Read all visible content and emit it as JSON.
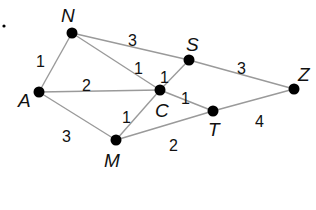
{
  "diagram": {
    "type": "weighted-graph",
    "nodes": [
      {
        "id": "N",
        "label": "N",
        "x": 72,
        "y": 33,
        "lx": 61,
        "ly": 22
      },
      {
        "id": "S",
        "label": "S",
        "x": 189,
        "y": 60,
        "lx": 186,
        "ly": 51
      },
      {
        "id": "Z",
        "label": "Z",
        "x": 294,
        "y": 89,
        "lx": 298,
        "ly": 81
      },
      {
        "id": "A",
        "label": "A",
        "x": 39,
        "y": 92,
        "lx": 18,
        "ly": 107
      },
      {
        "id": "C",
        "label": "C",
        "x": 160,
        "y": 90,
        "lx": 155,
        "ly": 117
      },
      {
        "id": "T",
        "label": "T",
        "x": 213,
        "y": 111,
        "lx": 208,
        "ly": 136
      },
      {
        "id": "M",
        "label": "M",
        "x": 116,
        "y": 140,
        "lx": 104,
        "ly": 167
      }
    ],
    "edges": [
      {
        "from": "N",
        "to": "A",
        "weight": "1",
        "wx": 36,
        "wy": 61
      },
      {
        "from": "N",
        "to": "S",
        "weight": "3",
        "wx": 128,
        "wy": 40
      },
      {
        "from": "N",
        "to": "C",
        "weight": "1",
        "wx": 134,
        "wy": 68
      },
      {
        "from": "S",
        "to": "C",
        "weight": "1",
        "wx": 160,
        "wy": 77
      },
      {
        "from": "S",
        "to": "Z",
        "weight": "3",
        "wx": 237,
        "wy": 68
      },
      {
        "from": "A",
        "to": "C",
        "weight": "2",
        "wx": 82,
        "wy": 85
      },
      {
        "from": "A",
        "to": "M",
        "weight": "3",
        "wx": 62,
        "wy": 136
      },
      {
        "from": "M",
        "to": "C",
        "weight": "1",
        "wx": 122,
        "wy": 117
      },
      {
        "from": "C",
        "to": "T",
        "weight": "1",
        "wx": 181,
        "wy": 98
      },
      {
        "from": "M",
        "to": "T",
        "weight": "2",
        "wx": 169,
        "wy": 145
      },
      {
        "from": "T",
        "to": "Z",
        "weight": "4",
        "wx": 255,
        "wy": 121
      }
    ],
    "stray_dot": {
      "x": 4,
      "y": 26
    }
  }
}
